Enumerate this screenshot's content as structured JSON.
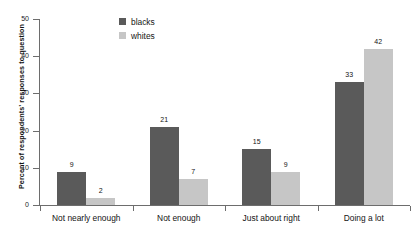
{
  "chart_data": {
    "type": "bar",
    "title": "",
    "subtitle": "",
    "xlabel": "",
    "ylabel": "Percent of respondents' responses to question",
    "ylim": [
      0,
      50
    ],
    "yticks": [
      0,
      10,
      20,
      30,
      40,
      50
    ],
    "ytick_labels": [
      "0",
      "10",
      "20",
      "30",
      "40",
      "50"
    ],
    "grid": false,
    "legend_position": "top-center",
    "categories": [
      "Not nearly enough",
      "Not enough",
      "Just about right",
      "Doing a lot"
    ],
    "series": [
      {
        "name": "blacks",
        "color": "#5a5a5a",
        "values": [
          9,
          21,
          15,
          33
        ]
      },
      {
        "name": "whites",
        "color": "#c6c6c6",
        "values": [
          2,
          7,
          9,
          42
        ]
      }
    ],
    "value_labels": {
      "blacks": [
        "9",
        "21",
        "15",
        "33"
      ],
      "whites": [
        "2",
        "7",
        "9",
        "42"
      ]
    }
  },
  "legend": {
    "items": [
      {
        "label": "blacks",
        "color": "#5a5a5a"
      },
      {
        "label": "whites",
        "color": "#c6c6c6"
      }
    ]
  },
  "colors": {
    "blacks": "#5a5a5a",
    "whites": "#c6c6c6",
    "axis": "#6d6d6d",
    "text": "#141414",
    "background": "#ffffff"
  }
}
